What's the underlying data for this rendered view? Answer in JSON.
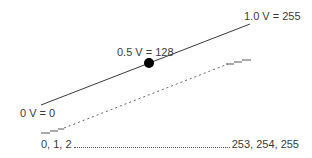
{
  "diagram": {
    "labels": {
      "top": "1.0 V = 255",
      "middle": "0.5 V = 128",
      "bottom": "0 V = 0"
    },
    "scale": {
      "start": "0, 1, 2",
      "end": "253, 254, 255"
    },
    "colors": {
      "line": "#333333",
      "dashed_line": "#666666",
      "dot": "#000000",
      "text": "#3a3a3a",
      "background": "#ffffff"
    },
    "elements": {
      "analog_line": {
        "from": [
          41,
          105
        ],
        "to": [
          250,
          24
        ],
        "style": "solid"
      },
      "midpoint_marker": {
        "center": [
          149,
          63
        ],
        "radius": 5
      },
      "digital_staircase": {
        "from": [
          60,
          128
        ],
        "to": [
          238,
          60
        ],
        "style": "dashed",
        "steps_at_ends": true
      }
    }
  }
}
